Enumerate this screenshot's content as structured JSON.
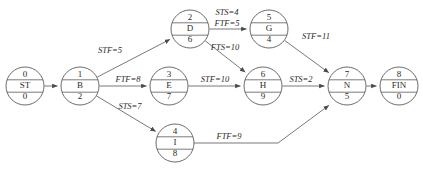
{
  "diagram": {
    "colors": {
      "node_stroke": "#5a5a5a",
      "edge_stroke": "#6a6a6a",
      "text": "#2b2b2b",
      "background": "#ffffff"
    },
    "nodes": [
      {
        "id": "n0",
        "index": "0",
        "name": "ST",
        "duration": "0",
        "cx": 25,
        "cy": 86,
        "r": 19
      },
      {
        "id": "n1",
        "index": "1",
        "name": "B",
        "duration": "2",
        "cx": 80,
        "cy": 86,
        "r": 19
      },
      {
        "id": "n2",
        "index": "2",
        "name": "D",
        "duration": "6",
        "cx": 190,
        "cy": 29,
        "r": 19
      },
      {
        "id": "n3",
        "index": "3",
        "name": "E",
        "duration": "7",
        "cx": 169,
        "cy": 86,
        "r": 19
      },
      {
        "id": "n4",
        "index": "4",
        "name": "I",
        "duration": "8",
        "cx": 175,
        "cy": 143,
        "r": 19
      },
      {
        "id": "n5",
        "index": "5",
        "name": "G",
        "duration": "4",
        "cx": 269,
        "cy": 29,
        "r": 19
      },
      {
        "id": "n6",
        "index": "6",
        "name": "H",
        "duration": "9",
        "cx": 263,
        "cy": 86,
        "r": 19
      },
      {
        "id": "n7",
        "index": "7",
        "name": "N",
        "duration": "5",
        "cx": 347,
        "cy": 86,
        "r": 19
      },
      {
        "id": "n8",
        "index": "8",
        "name": "FIN",
        "duration": "0",
        "cx": 399,
        "cy": 86,
        "r": 19
      }
    ],
    "edges": [
      {
        "id": "e0",
        "from": "n0",
        "to": "n1",
        "labels": []
      },
      {
        "id": "e1",
        "from": "n1",
        "to": "n2",
        "labels": [
          "STF=5"
        ]
      },
      {
        "id": "e2",
        "from": "n1",
        "to": "n3",
        "labels": [
          "FTF=8"
        ]
      },
      {
        "id": "e3",
        "from": "n1",
        "to": "n4",
        "labels": [
          "STS=7"
        ]
      },
      {
        "id": "e4",
        "from": "n2",
        "to": "n5",
        "labels": [
          "STS=4",
          "FTF=5"
        ]
      },
      {
        "id": "e5",
        "from": "n2",
        "to": "n6",
        "labels": [
          "FTS=10"
        ]
      },
      {
        "id": "e6",
        "from": "n3",
        "to": "n6",
        "labels": [
          "STF=10"
        ]
      },
      {
        "id": "e7",
        "from": "n5",
        "to": "n7",
        "labels": [
          "STF=11"
        ]
      },
      {
        "id": "e8",
        "from": "n6",
        "to": "n7",
        "labels": [
          "STS=2"
        ]
      },
      {
        "id": "e9",
        "from": "n4",
        "to": "n7",
        "labels": [
          "FTF=9"
        ]
      },
      {
        "id": "e10",
        "from": "n7",
        "to": "n8",
        "labels": []
      }
    ],
    "edge_labels": [
      {
        "id": "l_stf5",
        "text": "STF=5",
        "x": 110,
        "y": 51
      },
      {
        "id": "l_ftf8",
        "text": "FTF=8",
        "x": 128,
        "y": 80
      },
      {
        "id": "l_sts7",
        "text": "STS=7",
        "x": 130,
        "y": 107
      },
      {
        "id": "l_sts4",
        "text": "STS=4",
        "x": 227,
        "y": 13
      },
      {
        "id": "l_ftf5",
        "text": "FTF=5",
        "x": 227,
        "y": 24
      },
      {
        "id": "l_fts10",
        "text": "FTS=10",
        "x": 225,
        "y": 48
      },
      {
        "id": "l_stf10",
        "text": "STF=10",
        "x": 215,
        "y": 80
      },
      {
        "id": "l_stf11",
        "text": "STF=11",
        "x": 316,
        "y": 37
      },
      {
        "id": "l_sts2",
        "text": "STS=2",
        "x": 301,
        "y": 80
      },
      {
        "id": "l_ftf9",
        "text": "FTF=9",
        "x": 229,
        "y": 137
      }
    ],
    "node_text_offsets": {
      "index_dy": -11,
      "name_dy": 0,
      "duration_dy": 11
    }
  }
}
